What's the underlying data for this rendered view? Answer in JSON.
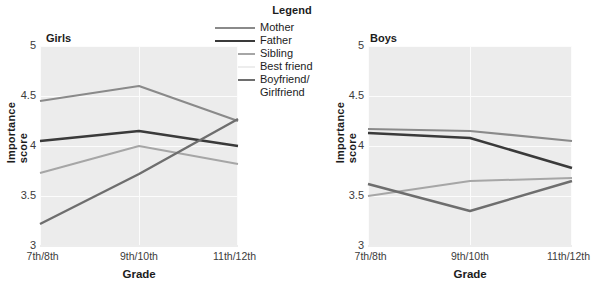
{
  "legend": {
    "title": "Legend",
    "entries": [
      {
        "label": "Mother",
        "color": "#8a8a8a",
        "width": 2.2
      },
      {
        "label": "Father",
        "color": "#3a3a3a",
        "width": 2.6
      },
      {
        "label": "Sibling",
        "color": "#a6a6a6",
        "width": 2.0
      },
      {
        "label": "Best friend",
        "color": "#ededed",
        "width": 2.0
      },
      {
        "label": "Boyfriend/",
        "color": "#6e6e6e",
        "width": 2.4,
        "label_line2": "Girlfriend"
      }
    ]
  },
  "panels": [
    {
      "id": "girls",
      "title": "Girls",
      "ylabel": "Importance score",
      "xlabel": "Grade",
      "yticks": [
        "5",
        "4.5",
        "4",
        "3.5",
        "3"
      ],
      "xticks": [
        "7th/8th",
        "9th/10th",
        "11th/12th"
      ]
    },
    {
      "id": "boys",
      "title": "Boys",
      "ylabel": "Importance score",
      "xlabel": "Grade",
      "yticks": [
        "5",
        "4.5",
        "4",
        "3.5",
        "3"
      ],
      "xticks": [
        "7th/8th",
        "9th/10th",
        "11th/12th"
      ]
    }
  ],
  "chart_data": [
    {
      "type": "line",
      "title": "Girls",
      "xlabel": "Grade",
      "ylabel": "Importance score",
      "categories": [
        "7th/8th",
        "9th/10th",
        "11th/12th"
      ],
      "ylim": [
        3,
        5
      ],
      "yticks": [
        3,
        3.5,
        4,
        4.5,
        5
      ],
      "grid": true,
      "legend_position": "top-center",
      "series": [
        {
          "name": "Mother",
          "color": "#8a8a8a",
          "values": [
            4.45,
            4.6,
            4.25
          ]
        },
        {
          "name": "Father",
          "color": "#3a3a3a",
          "values": [
            4.05,
            4.15,
            4.0
          ]
        },
        {
          "name": "Sibling",
          "color": "#a6a6a6",
          "values": [
            3.73,
            4.0,
            3.82
          ]
        },
        {
          "name": "Best friend",
          "color": "#ededed",
          "values": [
            3.0,
            3.0,
            3.0
          ]
        },
        {
          "name": "Boyfriend/Girlfriend",
          "color": "#6e6e6e",
          "values": [
            3.22,
            3.72,
            4.27
          ]
        }
      ]
    },
    {
      "type": "line",
      "title": "Boys",
      "xlabel": "Grade",
      "ylabel": "Importance score",
      "categories": [
        "7th/8th",
        "9th/10th",
        "11th/12th"
      ],
      "ylim": [
        3,
        5
      ],
      "yticks": [
        3,
        3.5,
        4,
        4.5,
        5
      ],
      "grid": true,
      "legend_position": "top-center",
      "series": [
        {
          "name": "Mother",
          "color": "#8a8a8a",
          "values": [
            4.17,
            4.15,
            4.05
          ]
        },
        {
          "name": "Father",
          "color": "#3a3a3a",
          "values": [
            4.13,
            4.08,
            3.78
          ]
        },
        {
          "name": "Sibling",
          "color": "#a6a6a6",
          "values": [
            3.5,
            3.65,
            3.68
          ]
        },
        {
          "name": "Best friend",
          "color": "#ededed",
          "values": [
            3.0,
            3.0,
            3.0
          ]
        },
        {
          "name": "Boyfriend/Girlfriend",
          "color": "#6e6e6e",
          "values": [
            3.62,
            3.35,
            3.65
          ]
        }
      ]
    }
  ]
}
